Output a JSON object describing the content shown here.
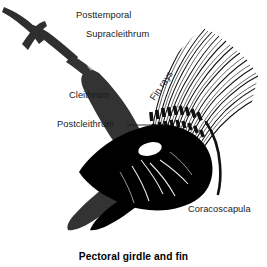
{
  "figure": {
    "caption": "Pectoral girdle and fin",
    "background_color": "#ffffff",
    "bone_fill_dark": "#333333",
    "bone_fill_black": "#000000",
    "line_color": "#1a1a1a"
  },
  "labels": [
    {
      "id": "posttemporal",
      "text": "Posttemporal",
      "rotated": false
    },
    {
      "id": "supracleithrum",
      "text": "Supracleithrum",
      "rotated": false
    },
    {
      "id": "cleithrum",
      "text": "Cleithrum",
      "rotated": false
    },
    {
      "id": "postcleithrum",
      "text": "Postcleithrum",
      "rotated": false
    },
    {
      "id": "fin-rays",
      "text": "Fin rays",
      "rotated": true
    },
    {
      "id": "coracoscapula",
      "text": "Coracoscapula",
      "rotated": false
    }
  ],
  "structures": {
    "posttemporal": "forked Y-shaped bone at upper left",
    "supracleithrum": "slender strut descending from posttemporal",
    "cleithrum": "long curved boomerang-shaped bone",
    "postcleithrum": "small element behind cleithrum",
    "coracoscapula": "solid black plate with oval foramen",
    "fin_rays": "fan of thin segmented rays"
  }
}
